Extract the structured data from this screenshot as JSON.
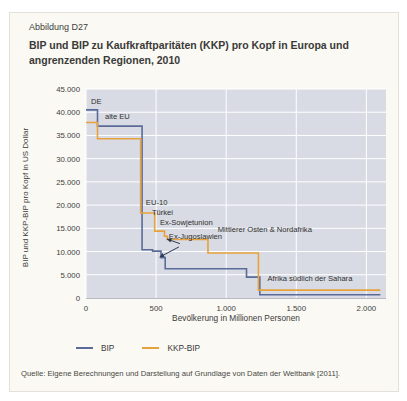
{
  "header": {
    "figure_label": "Abbildung D27",
    "title": "BIP und BIP zu Kaufkraftparitäten (KKP) pro Kopf in Europa und angrenzenden Regionen, 2010"
  },
  "source": "Quelle: Eigene Berechnungen und Darstellung auf Grundlage von Daten der Weltbank [2011].",
  "legend": [
    {
      "label": "BIP",
      "color": "#5b6b99"
    },
    {
      "label": "KKP-BIP",
      "color": "#e7a23c"
    }
  ],
  "colors": {
    "plot_background": "#d8dbe4",
    "gridline": "#ffffff",
    "bip_line": "#5b6b99",
    "kkp_line": "#e7a23c",
    "arrow": "#2b3a55",
    "card_background": "#faf9f4"
  },
  "chart_data": {
    "type": "line",
    "subtype": "step",
    "title": "BIP und BIP zu Kaufkraftparitäten (KKP) pro Kopf in Europa und angrenzenden Regionen, 2010",
    "xlabel": "Bevölkerung in Millionen Personen",
    "ylabel": "BIP und KKP-BIP pro Kopf in US Dollar",
    "xlim": [
      0,
      2140
    ],
    "ylim": [
      0,
      45000
    ],
    "grid": true,
    "legend_position": "bottom",
    "x_ticks": [
      {
        "value": 0,
        "label": "0"
      },
      {
        "value": 500,
        "label": "500"
      },
      {
        "value": 1000,
        "label": "1.000"
      },
      {
        "value": 1500,
        "label": "1.500"
      },
      {
        "value": 2000,
        "label": "2.000"
      }
    ],
    "y_ticks": [
      {
        "value": 0,
        "label": "0"
      },
      {
        "value": 5000,
        "label": "5.000"
      },
      {
        "value": 10000,
        "label": "10.000"
      },
      {
        "value": 15000,
        "label": "15.000"
      },
      {
        "value": 20000,
        "label": "20.000"
      },
      {
        "value": 25000,
        "label": "25.000"
      },
      {
        "value": 30000,
        "label": "30.000"
      },
      {
        "value": 35000,
        "label": "35.000"
      },
      {
        "value": 40000,
        "label": "40.000"
      },
      {
        "value": 45000,
        "label": "45.000"
      }
    ],
    "series": [
      {
        "name": "BIP",
        "color": "#5b6b99",
        "steps": [
          {
            "region": "DE",
            "from": 0,
            "to": 82,
            "value": 40500
          },
          {
            "region": "alte EU",
            "from": 82,
            "to": 400,
            "value": 37000
          },
          {
            "region": "EU-10",
            "from": 400,
            "to": 475,
            "value": 10400
          },
          {
            "region": "Türkei",
            "from": 475,
            "to": 535,
            "value": 10100
          },
          {
            "region": "Ex-Jugoslawien",
            "from": 535,
            "to": 565,
            "value": 8700
          },
          {
            "region": "Ex-Sowjetunion",
            "from": 565,
            "to": 1145,
            "value": 6300
          },
          {
            "region": "Mittlerer Osten & Nordafrika",
            "from": 1145,
            "to": 1240,
            "value": 4500
          },
          {
            "region": "Afrika südlich der Sahara",
            "from": 1240,
            "to": 2100,
            "value": 700
          }
        ]
      },
      {
        "name": "KKP-BIP",
        "color": "#e7a23c",
        "steps": [
          {
            "region": "DE",
            "from": 0,
            "to": 82,
            "value": 37800
          },
          {
            "region": "alte EU",
            "from": 82,
            "to": 390,
            "value": 34300
          },
          {
            "region": "EU-10",
            "from": 390,
            "to": 490,
            "value": 18300
          },
          {
            "region": "Türkei",
            "from": 490,
            "to": 560,
            "value": 14400
          },
          {
            "region": "Ex-Jugoslawien",
            "from": 560,
            "to": 580,
            "value": 13300
          },
          {
            "region": "Ex-Sowjetunion",
            "from": 580,
            "to": 870,
            "value": 12600
          },
          {
            "region": "Mittlerer Osten & Nordafrika",
            "from": 870,
            "to": 1230,
            "value": 9700
          },
          {
            "region": "Afrika südlich der Sahara",
            "from": 1230,
            "to": 2100,
            "value": 1700
          }
        ]
      }
    ],
    "annotations": [
      {
        "label": "DE",
        "x": 36,
        "y": 43300
      },
      {
        "label": "alte EU",
        "x": 135,
        "y": 40000
      },
      {
        "label": "EU-10",
        "x": 427,
        "y": 21500
      },
      {
        "label": "Türkei",
        "x": 470,
        "y": 19400
      },
      {
        "label": "Ex-Sowjetunion",
        "x": 527,
        "y": 17200
      },
      {
        "label": "Mittlerer Osten & Nordafrika",
        "x": 940,
        "y": 15700
      },
      {
        "label": "Ex-Jugoslawien",
        "x": 591,
        "y": 14200
      },
      {
        "label": "Afrika südlich der Sahara",
        "x": 1295,
        "y": 5200
      }
    ],
    "arrows": [
      {
        "from_x": 670,
        "from_y": 11700,
        "to_x": 577,
        "to_y": 12700
      },
      {
        "from_x": 663,
        "from_y": 11000,
        "to_x": 525,
        "to_y": 8800
      }
    ]
  }
}
